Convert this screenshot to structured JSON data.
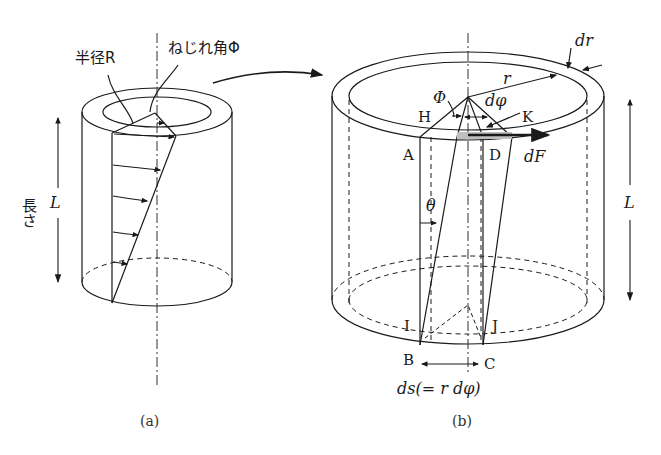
{
  "figure_a": {
    "radius_label": "半径R",
    "twist_angle_label": "ねじれ角Φ",
    "length_label_jp": "長さ",
    "length_symbol": "L",
    "caption": "(a)"
  },
  "figure_b": {
    "dr_label": "dr",
    "r_label": "r",
    "phi_label": "Φ",
    "dphi_label": "dφ",
    "points": {
      "H": "H",
      "K": "K",
      "A": "A",
      "D": "D",
      "I": "I",
      "J": "J",
      "B": "B",
      "C": "C"
    },
    "force_label": "dF",
    "theta_label": "θ",
    "length_symbol": "L",
    "ds_label": "ds(= r dφ)",
    "caption": "(b)"
  },
  "colors": {
    "line": "#1a1a1a",
    "shade": "#bfbfbf"
  }
}
